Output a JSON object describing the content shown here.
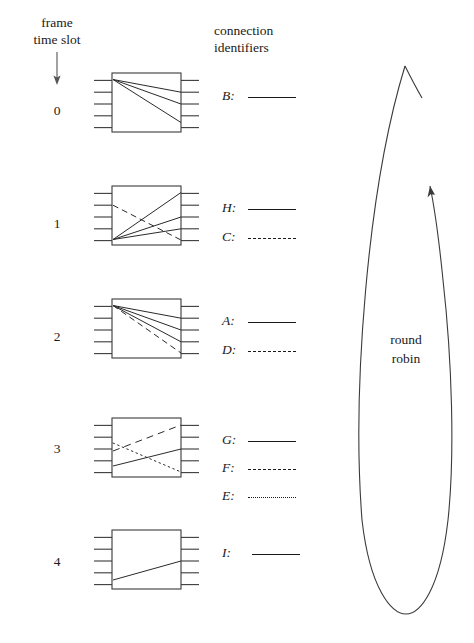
{
  "figure": {
    "title_label": "frame time slot",
    "frame_label_lines": [
      "frame",
      "time slot"
    ],
    "connection_label_lines": [
      "connection",
      "identifiers"
    ],
    "round_robin_lines": [
      "round",
      "robin"
    ],
    "arrow_icon": "down-arrow-icon",
    "loop_arrow_icon": "round-robin-loop-arrow-icon",
    "colors": {
      "ink": "#1a1a1a",
      "background": "#ffffff"
    }
  },
  "slots": [
    {
      "number": "0",
      "box_name": "switch-box-slot-0",
      "inputs": 5,
      "outputs": 5,
      "connections": [
        {
          "id": "B",
          "style": "solid",
          "from_port": 1,
          "to_port": 2
        },
        {
          "id": "B",
          "style": "solid",
          "from_port": 1,
          "to_port": 3
        },
        {
          "id": "B",
          "style": "solid",
          "from_port": 1,
          "to_port": 4
        }
      ],
      "legend": [
        {
          "id": "B:",
          "style": "solid"
        }
      ]
    },
    {
      "number": "1",
      "box_name": "switch-box-slot-1",
      "inputs": 5,
      "outputs": 5,
      "connections": [
        {
          "id": "H",
          "style": "solid",
          "from_port": 5,
          "to_port": 1
        },
        {
          "id": "H",
          "style": "solid",
          "from_port": 5,
          "to_port": 3
        },
        {
          "id": "H",
          "style": "solid",
          "from_port": 5,
          "to_port": 4
        },
        {
          "id": "C",
          "style": "dashed",
          "from_port": 2,
          "to_port": 5
        }
      ],
      "legend": [
        {
          "id": "H:",
          "style": "solid"
        },
        {
          "id": "C:",
          "style": "dashed"
        }
      ]
    },
    {
      "number": "2",
      "box_name": "switch-box-slot-2",
      "inputs": 5,
      "outputs": 5,
      "connections": [
        {
          "id": "A",
          "style": "solid",
          "from_port": 1,
          "to_port": 2
        },
        {
          "id": "A",
          "style": "solid",
          "from_port": 1,
          "to_port": 3
        },
        {
          "id": "A",
          "style": "solid",
          "from_port": 1,
          "to_port": 4
        },
        {
          "id": "D",
          "style": "dashed",
          "from_port": 1,
          "to_port": 5
        }
      ],
      "legend": [
        {
          "id": "A:",
          "style": "solid"
        },
        {
          "id": "D:",
          "style": "dashed"
        }
      ]
    },
    {
      "number": "3",
      "box_name": "switch-box-slot-3",
      "inputs": 5,
      "outputs": 5,
      "connections": [
        {
          "id": "G",
          "style": "solid",
          "from_port": 5,
          "to_port": 3
        },
        {
          "id": "F",
          "style": "dashed",
          "from_port": 3,
          "to_port": 1
        },
        {
          "id": "E",
          "style": "dotted",
          "from_port": 3,
          "to_port": 5
        }
      ],
      "legend": [
        {
          "id": "G:",
          "style": "solid"
        },
        {
          "id": "F:",
          "style": "dashed"
        },
        {
          "id": "E:",
          "style": "dotted"
        }
      ]
    },
    {
      "number": "4",
      "box_name": "switch-box-slot-4",
      "inputs": 5,
      "outputs": 5,
      "connections": [
        {
          "id": "I",
          "style": "solid",
          "from_port": 5,
          "to_port": 3
        }
      ],
      "legend": [
        {
          "id": "I:",
          "style": "solid"
        }
      ]
    }
  ]
}
